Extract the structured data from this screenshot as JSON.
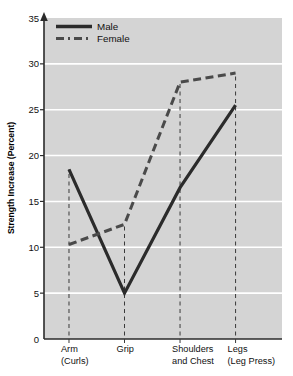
{
  "chart_data": {
    "type": "line",
    "title": "",
    "subtitle": "",
    "xlabel": "",
    "ylabel": "Strength Increase (Percent)",
    "categories": [
      "Arm\n(Curls)",
      "Grip",
      "Shoulders\nand Chest",
      "Legs\n(Leg Press)"
    ],
    "category_lines": [
      [
        "Arm",
        "(Curls)"
      ],
      [
        "Grip",
        ""
      ],
      [
        "Shoulders",
        "and Chest"
      ],
      [
        "Legs",
        "(Leg Press)"
      ]
    ],
    "series": [
      {
        "name": "Male",
        "values": [
          18.5,
          5.0,
          16.5,
          25.5
        ],
        "style": "solid",
        "color": "#2b2b2b"
      },
      {
        "name": "Female",
        "values": [
          10.3,
          12.5,
          28.0,
          29.0
        ],
        "style": "dashed",
        "color": "#4a4a4a"
      }
    ],
    "ylim": [
      0,
      35
    ],
    "yticks": [
      0,
      5,
      10,
      15,
      20,
      25,
      30,
      35
    ],
    "ytick_labels": [
      "0",
      "5",
      "10",
      "15",
      "20",
      "25",
      "30",
      "35"
    ],
    "grid": true,
    "grid_color": "#ffffff",
    "plot_background": "#d4d4d4",
    "legend_position": "top-left",
    "legend_entries": [
      "Male",
      "Female"
    ]
  },
  "axes": {
    "y_axis_title": "Strength Increase (Percent)",
    "y_axis_arrow": true
  }
}
